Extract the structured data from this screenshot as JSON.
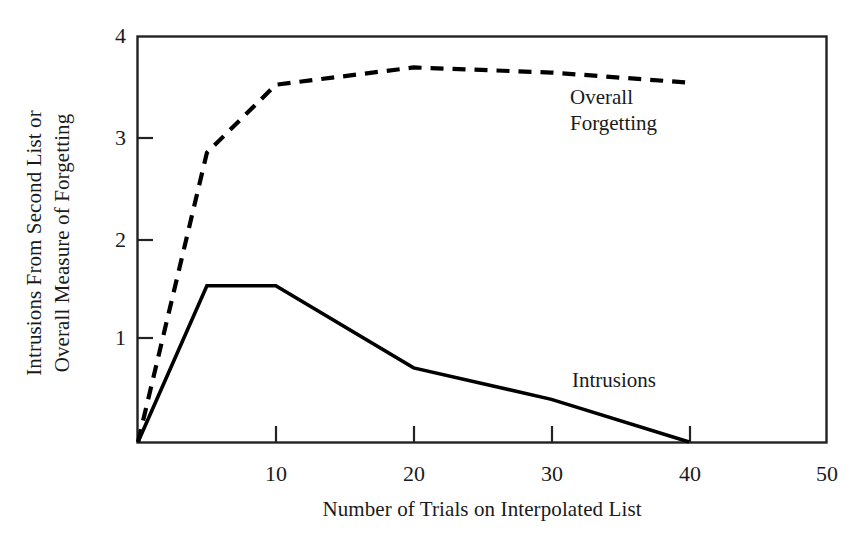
{
  "chart_data": {
    "type": "line",
    "title": "",
    "subtitle": "",
    "xlabel": "Number of Trials on Interpolated List",
    "ylabel": "Intrusions From Second List or Overall Measure of Forgetting",
    "ylabel_line1": "Intrusions From Second List or",
    "ylabel_line2": "Overall Measure of Forgetting",
    "xlim": [
      0,
      50
    ],
    "ylim": [
      0,
      4
    ],
    "xticks": [
      10,
      20,
      30,
      40,
      50
    ],
    "xtick_labels": [
      "10",
      "20",
      "30",
      "40",
      "50"
    ],
    "yticks": [
      1,
      2,
      3,
      4
    ],
    "ytick_labels": [
      "1",
      "2",
      "3",
      "4"
    ],
    "grid": false,
    "legend_position": "inline-annotation",
    "series": [
      {
        "name": "Overall Forgetting",
        "style": "dashed",
        "color": "#000000",
        "x": [
          0,
          5,
          10,
          20,
          30,
          40
        ],
        "values": [
          0,
          2.85,
          3.52,
          3.69,
          3.64,
          3.54
        ]
      },
      {
        "name": "Intrusions",
        "style": "solid",
        "color": "#000000",
        "x": [
          0,
          5,
          10,
          20,
          30,
          40
        ],
        "values": [
          0,
          1.54,
          1.54,
          0.73,
          0.42,
          0.0
        ]
      }
    ],
    "annotations": [
      {
        "text_line1": "Overall",
        "text_line2": "Forgetting",
        "x": 31,
        "y": 3.38
      },
      {
        "text_line1": "Intrusions",
        "text_line2": "",
        "x": 31.5,
        "y": 0.78
      }
    ]
  },
  "axes": {
    "y_title_line1": "Intrusions From Second List or",
    "y_title_line2": "Overall Measure of Forgetting",
    "x_title": "Number of Trials on Interpolated List",
    "ytick_4": "4",
    "ytick_3": "3",
    "ytick_2": "2",
    "ytick_1": "1",
    "xtick_10": "10",
    "xtick_20": "20",
    "xtick_30": "30",
    "xtick_40": "40",
    "xtick_50": "50"
  },
  "annotations": {
    "overall_line1": "Overall",
    "overall_line2": "Forgetting",
    "intrusions": "Intrusions"
  },
  "colors": {
    "axis": "#222222",
    "series": "#000000",
    "background": "#ffffff"
  }
}
